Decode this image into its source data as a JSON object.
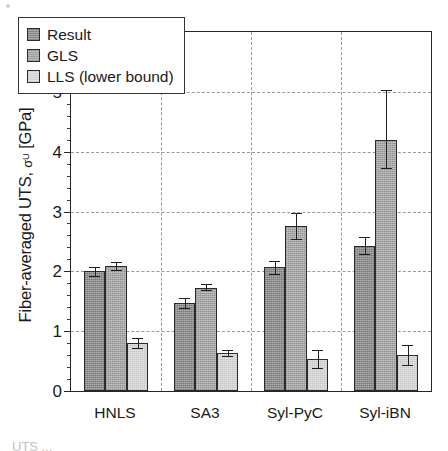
{
  "chart_data": {
    "type": "bar",
    "title": "",
    "xlabel": "",
    "ylabel": "Fiber-averaged UTS, σᵁ [GPa]",
    "ylabel_parts": {
      "main": "Fiber-averaged UTS,",
      "symbol": "σ",
      "superscript": "U",
      "units": "[GPa]"
    },
    "categories": [
      "HNLS",
      "SA3",
      "Syl-PyC",
      "Syl-iBN"
    ],
    "ylim": [
      0,
      6
    ],
    "yticks": [
      0,
      1,
      2,
      3,
      4,
      5,
      6
    ],
    "ytick_labels": [
      "0",
      "1",
      "2",
      "3",
      "4",
      "5",
      "6"
    ],
    "minor_ticks_per_interval": 5,
    "grid": "dashed-both",
    "legend_position": "upper-left-inside",
    "series": [
      {
        "name": "Result",
        "color": "#9d9d9d",
        "values": [
          2.0,
          1.47,
          2.07,
          2.43
        ],
        "err_low": [
          0.07,
          0.08,
          0.11,
          0.14
        ],
        "err_high": [
          0.07,
          0.08,
          0.11,
          0.14
        ]
      },
      {
        "name": "GLS",
        "color": "#b2b2b2",
        "values": [
          2.09,
          1.73,
          2.76,
          4.19
        ],
        "err_low": [
          0.07,
          0.05,
          0.22,
          0.47
        ],
        "err_high": [
          0.07,
          0.05,
          0.22,
          0.84
        ]
      },
      {
        "name": "LLS (lower bound)",
        "color": "#dcdcdc",
        "values": [
          0.8,
          0.64,
          0.53,
          0.6
        ],
        "err_low": [
          0.08,
          0.05,
          0.15,
          0.17
        ],
        "err_high": [
          0.08,
          0.05,
          0.15,
          0.17
        ]
      }
    ]
  },
  "legend": {
    "entries": [
      {
        "label": "Result"
      },
      {
        "label": "GLS"
      },
      {
        "label": "LLS (lower bound)"
      }
    ]
  },
  "caption": {
    "text": "UTS ..."
  }
}
